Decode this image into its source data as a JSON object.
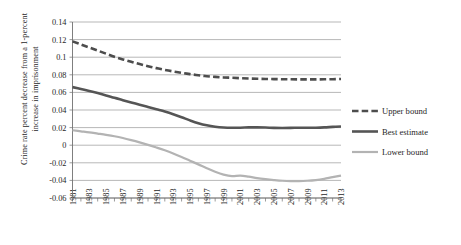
{
  "chart_data": {
    "type": "line",
    "title": "",
    "xlabel": "",
    "ylabel": "Crime rate percent decrease from a 1-percent increase in imprisonment",
    "ylabel_line1": "Crime rate percent decrease from a 1-percent",
    "ylabel_line2": "increase in imprisonment",
    "xlim": [
      1981,
      2013
    ],
    "ylim": [
      -0.06,
      0.14
    ],
    "grid": true,
    "legend_position": "right",
    "ytick_labels": [
      "0.14",
      "0.12",
      "0.1",
      "0.08",
      "0.06",
      "0.04",
      "0.02",
      "0",
      "-0.02",
      "-0.04",
      "-0.06"
    ],
    "yticks": [
      0.14,
      0.12,
      0.1,
      0.08,
      0.06,
      0.04,
      0.02,
      0,
      -0.02,
      -0.04,
      -0.06
    ],
    "xtick_labels": [
      "1981",
      "1983",
      "1985",
      "1987",
      "1989",
      "1991",
      "1993",
      "1995",
      "1997",
      "1999",
      "2001",
      "2003",
      "2005",
      "2007",
      "2009",
      "2011",
      "2013"
    ],
    "x": [
      1981,
      1982,
      1983,
      1984,
      1985,
      1986,
      1987,
      1988,
      1989,
      1990,
      1991,
      1992,
      1993,
      1994,
      1995,
      1996,
      1997,
      1998,
      1999,
      2000,
      2001,
      2002,
      2003,
      2004,
      2005,
      2006,
      2007,
      2008,
      2009,
      2010,
      2011,
      2012,
      2013
    ],
    "series": [
      {
        "name": "Upper bound",
        "color": "#4d4d4d",
        "style": "dashed",
        "width": 2.6,
        "values": [
          0.118,
          0.1145,
          0.111,
          0.1075,
          0.104,
          0.1005,
          0.0975,
          0.0948,
          0.0922,
          0.0898,
          0.0876,
          0.0856,
          0.0838,
          0.0822,
          0.0808,
          0.0795,
          0.0784,
          0.0776,
          0.077,
          0.0766,
          0.0762,
          0.0758,
          0.0755,
          0.0753,
          0.0751,
          0.075,
          0.0749,
          0.0748,
          0.0748,
          0.0748,
          0.0749,
          0.075,
          0.0752
        ]
      },
      {
        "name": "Best estimate",
        "color": "#555555",
        "style": "solid",
        "width": 2.6,
        "values": [
          0.066,
          0.0638,
          0.0616,
          0.0592,
          0.0566,
          0.0538,
          0.0512,
          0.0486,
          0.046,
          0.0434,
          0.0408,
          0.0382,
          0.0352,
          0.0318,
          0.0282,
          0.025,
          0.0226,
          0.021,
          0.0201,
          0.0198,
          0.0199,
          0.0202,
          0.0203,
          0.0201,
          0.0197,
          0.0196,
          0.0197,
          0.0199,
          0.0199,
          0.0199,
          0.0202,
          0.0208,
          0.0213
        ]
      },
      {
        "name": "Lower bound",
        "color": "#b3b3b3",
        "style": "solid",
        "width": 2.2,
        "values": [
          0.017,
          0.0158,
          0.0146,
          0.0132,
          0.0118,
          0.0102,
          0.0082,
          0.0058,
          0.0032,
          0.0004,
          -0.0026,
          -0.0058,
          -0.0094,
          -0.0134,
          -0.0176,
          -0.0218,
          -0.0262,
          -0.0302,
          -0.0334,
          -0.0352,
          -0.0346,
          -0.0358,
          -0.0374,
          -0.0386,
          -0.0396,
          -0.0404,
          -0.0408,
          -0.0408,
          -0.0404,
          -0.0396,
          -0.0382,
          -0.0362,
          -0.0345
        ]
      }
    ]
  },
  "legend": {
    "items": [
      {
        "label": "Upper bound"
      },
      {
        "label": "Best estimate"
      },
      {
        "label": "Lower bound"
      }
    ]
  }
}
